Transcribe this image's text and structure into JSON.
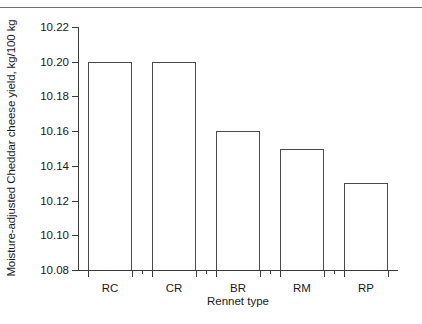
{
  "figure": {
    "top_rule_color": "#6e6e6e",
    "axis_color": "#3a3a3a",
    "bar_outline_color": "#4a4a4a",
    "background": "#ffffff"
  },
  "chart_data": {
    "type": "bar",
    "title": "",
    "xlabel": "Rennet type",
    "ylabel": "Moisture-adjusted Cheddar cheese yield, kg/100 kg",
    "categories": [
      "RC",
      "CR",
      "BR",
      "RM",
      "RP"
    ],
    "values": [
      10.2,
      10.2,
      10.16,
      10.15,
      10.13
    ],
    "ylim": [
      10.08,
      10.22
    ],
    "ytick_labels": [
      "10.22",
      "10.20",
      "10.18",
      "10.16",
      "10.14",
      "10.12",
      "10.10",
      "10.08"
    ],
    "ytick_values": [
      10.22,
      10.2,
      10.18,
      10.16,
      10.14,
      10.12,
      10.1,
      10.08
    ],
    "ytick_step": 0.02,
    "grid": false,
    "legend": null,
    "bar_fill": "none",
    "bar_edge": "#4a4a4a"
  }
}
